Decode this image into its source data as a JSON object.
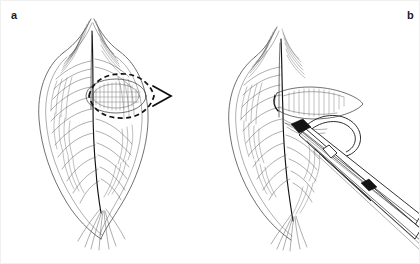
{
  "figure": {
    "panel_count": 2,
    "background_color": "#ffffff",
    "ink_color": "#2a2a2a",
    "border_color": "#f0f0f0"
  },
  "panels": [
    {
      "id": "a",
      "label": "a",
      "caption": "",
      "annotation_type": "dashed-ellipse-with-arrow",
      "annotation_color": "#111111",
      "elements": [
        "anatomical-drawing",
        "dashed-incision-outline",
        "direction-arrowhead"
      ]
    },
    {
      "id": "b",
      "label": "b",
      "caption": "",
      "annotation_type": "instrument-with-suture-loop",
      "annotation_color": "#1a1a1a",
      "elements": [
        "anatomical-drawing",
        "open-incision",
        "forceps-instrument",
        "suture-loop"
      ]
    }
  ]
}
